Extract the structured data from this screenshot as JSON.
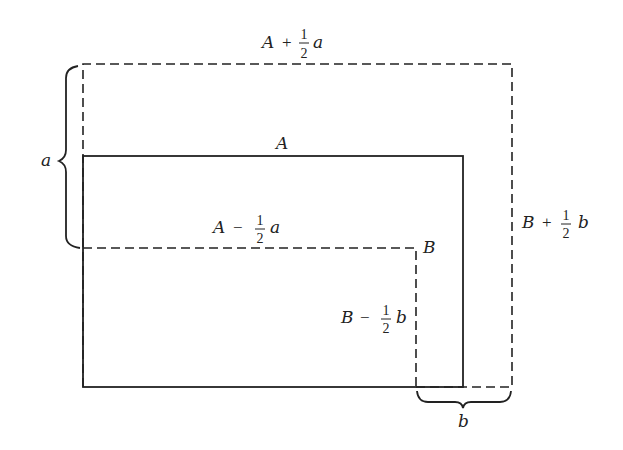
{
  "diagram": {
    "title": "",
    "colors": {
      "stroke": "#222222",
      "background": "#ffffff"
    },
    "rectangles": [
      {
        "name": "outer",
        "style": "dashed",
        "width_label": "A + ½ a",
        "height_label": "B + ½ b"
      },
      {
        "name": "original",
        "style": "solid",
        "width_label": "A",
        "height_label": "B"
      },
      {
        "name": "inner",
        "style": "dashed",
        "width_label": "A − ½ a",
        "height_label": "B − ½ b"
      }
    ],
    "labels": {
      "outer_width": {
        "var": "A",
        "op": "+",
        "num": "1",
        "den": "2",
        "coef": "a"
      },
      "outer_height": {
        "var": "B",
        "op": "+",
        "num": "1",
        "den": "2",
        "coef": "b"
      },
      "orig_width": "A",
      "orig_height": "B",
      "inner_width": {
        "var": "A",
        "op": "−",
        "num": "1",
        "den": "2",
        "coef": "a"
      },
      "inner_height": {
        "var": "B",
        "op": "−",
        "num": "1",
        "den": "2",
        "coef": "b"
      },
      "brace_left": "a",
      "brace_bottom": "b"
    }
  }
}
